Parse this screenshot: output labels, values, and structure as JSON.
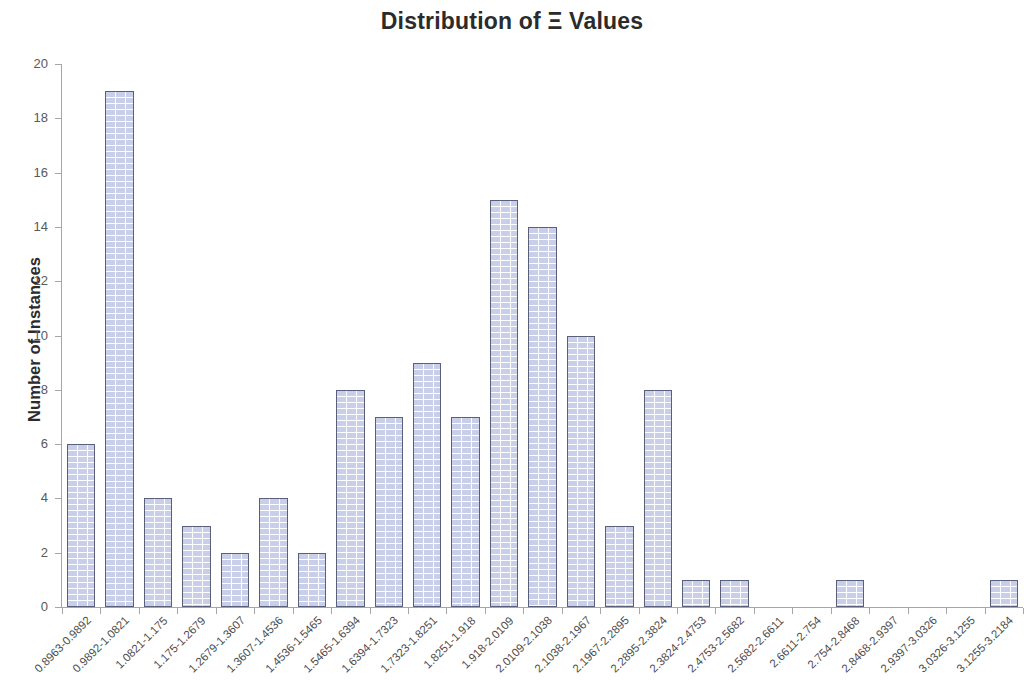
{
  "chart_data": {
    "type": "bar",
    "title": "Distribution of Ξ Values",
    "xlabel": "",
    "ylabel": "Number of Instances",
    "ylim": [
      0,
      20
    ],
    "ytick_step": 2,
    "ytick_labels": [
      "0",
      "2",
      "4",
      "6",
      "8",
      "10",
      "12",
      "14",
      "16",
      "18",
      "20"
    ],
    "grid": false,
    "legend": null,
    "bar_fill_color": "#c9cfe9",
    "bar_border_color": "#5a5f7a",
    "bar_pattern": "brick-hatch",
    "categories": [
      "0.8963-0.9892",
      "0.9892-1.0821",
      "1.0821-1.175",
      "1.175-1.2679",
      "1.2679-1.3607",
      "1.3607-1.4536",
      "1.4536-1.5465",
      "1.5465-1.6394",
      "1.6394-1.7323",
      "1.7323-1.8251",
      "1.8251-1.918",
      "1.918-2.0109",
      "2.0109-2.1038",
      "2.1038-2.1967",
      "2.1967-2.2895",
      "2.2895-2.3824",
      "2.3824-2.4753",
      "2.4753-2.5682",
      "2.5682-2.6611",
      "2.6611-2.754",
      "2.754-2.8468",
      "2.8468-2.9397",
      "2.9397-3.0326",
      "3.0326-3.1255",
      "3.1255-3.2184"
    ],
    "values": [
      6,
      19,
      4,
      3,
      2,
      4,
      2,
      8,
      7,
      9,
      7,
      15,
      14,
      10,
      3,
      8,
      1,
      1,
      0,
      0,
      1,
      0,
      0,
      0,
      1
    ]
  }
}
